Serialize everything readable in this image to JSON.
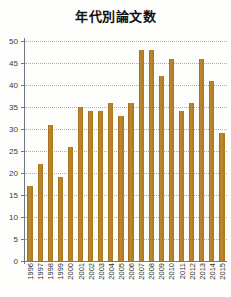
{
  "chart_data": {
    "type": "bar",
    "title": "年代別論文数",
    "xlabel": "",
    "ylabel": "",
    "ylim": [
      0,
      50
    ],
    "ytick_step": 5,
    "yticks": [
      0,
      5,
      10,
      15,
      20,
      25,
      30,
      35,
      40,
      45,
      50
    ],
    "grid": true,
    "legend": false,
    "bar_color": "#b5822a",
    "categories": [
      "1996",
      "1997",
      "1998",
      "1999",
      "2000",
      "2001",
      "2002",
      "2003",
      "2004",
      "2005",
      "2006",
      "2007",
      "2008",
      "2009",
      "2010",
      "2011",
      "2012",
      "2013",
      "2014",
      "2015"
    ],
    "values": [
      17,
      22,
      31,
      19,
      26,
      35,
      34,
      34,
      36,
      33,
      36,
      48,
      48,
      42,
      46,
      34,
      36,
      46,
      41,
      29
    ]
  }
}
